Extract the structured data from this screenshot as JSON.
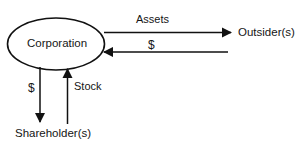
{
  "diagram": {
    "background_color": "#ffffff",
    "stroke_color": "#111111",
    "text_color": "#151515",
    "nodes": [
      {
        "id": "corporation",
        "label": "Corporation",
        "shape": "ellipse",
        "cx": 56,
        "cy": 44,
        "rx": 49,
        "ry": 26
      },
      {
        "id": "outsiders",
        "label": "Outsider(s)",
        "shape": "text"
      },
      {
        "id": "shareholders",
        "label": "Shareholder(s)",
        "shape": "text"
      }
    ],
    "edges": [
      {
        "id": "assets",
        "label": "Assets",
        "from": "corporation",
        "to": "outsiders",
        "direction": "right"
      },
      {
        "id": "cash-from-outsiders",
        "label": "$",
        "from": "outsiders",
        "to": "corporation",
        "direction": "left"
      },
      {
        "id": "cash-to-shareholders",
        "label": "$",
        "from": "corporation",
        "to": "shareholders",
        "direction": "down"
      },
      {
        "id": "stock-to-corporation",
        "label": "Stock",
        "from": "shareholders",
        "to": "corporation",
        "direction": "up"
      }
    ]
  }
}
